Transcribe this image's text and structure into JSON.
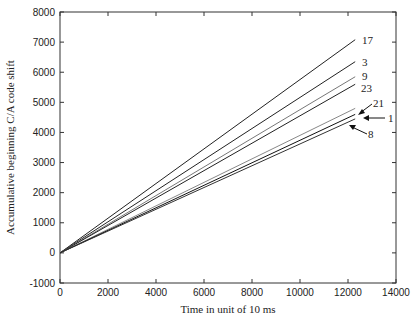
{
  "chart_data": {
    "type": "line",
    "title": "",
    "xlabel": "Time in unit of 10 ms",
    "ylabel": "Accumulative beginning C/A code shift",
    "xlim": [
      0,
      14000
    ],
    "ylim": [
      -1000,
      8000
    ],
    "xticks": [
      0,
      2000,
      4000,
      6000,
      8000,
      10000,
      12000,
      14000
    ],
    "yticks": [
      -1000,
      0,
      1000,
      2000,
      3000,
      4000,
      5000,
      6000,
      7000,
      8000
    ],
    "grid": false,
    "legend": "inline labels at line ends",
    "series": [
      {
        "name": "17",
        "x": [
          0,
          12300
        ],
        "values": [
          0,
          7080
        ]
      },
      {
        "name": "3",
        "x": [
          0,
          12300
        ],
        "values": [
          0,
          6350
        ]
      },
      {
        "name": "9",
        "x": [
          0,
          12300
        ],
        "values": [
          0,
          5850
        ]
      },
      {
        "name": "23",
        "x": [
          0,
          12300
        ],
        "values": [
          0,
          5600
        ]
      },
      {
        "name": "21",
        "x": [
          0,
          12300
        ],
        "values": [
          0,
          4800
        ]
      },
      {
        "name": "1",
        "x": [
          0,
          12300
        ],
        "values": [
          0,
          4600
        ]
      },
      {
        "name": "8",
        "x": [
          0,
          12300
        ],
        "values": [
          0,
          4450
        ]
      }
    ]
  }
}
